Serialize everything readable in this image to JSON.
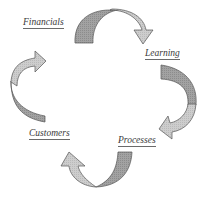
{
  "diagram": {
    "type": "cycle",
    "direction": "clockwise",
    "nodes": [
      {
        "id": "financials",
        "label": "Financials"
      },
      {
        "id": "learning",
        "label": "Learning"
      },
      {
        "id": "processes",
        "label": "Processes"
      },
      {
        "id": "customers",
        "label": "Customers"
      }
    ],
    "edges": [
      {
        "from": "financials",
        "to": "learning"
      },
      {
        "from": "learning",
        "to": "processes"
      },
      {
        "from": "processes",
        "to": "customers"
      },
      {
        "from": "customers",
        "to": "financials"
      }
    ],
    "colors": {
      "arrow_dark": "#9a9a9a",
      "arrow_light": "#c8c8c8",
      "outline": "#555555",
      "text": "#3a3a3a"
    }
  }
}
